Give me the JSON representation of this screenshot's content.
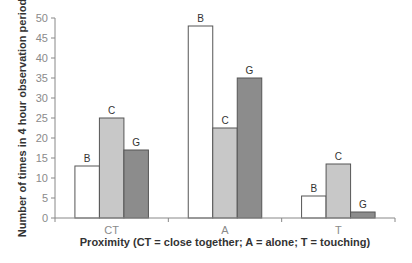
{
  "chart_data": {
    "type": "bar",
    "title": "",
    "xlabel": "Proximity (CT = close together; A = alone; T = touching)",
    "ylabel": "Number of times in 4 hour observation period",
    "categories": [
      "CT",
      "A",
      "T"
    ],
    "series": [
      {
        "name": "B",
        "color": "#ffffff",
        "values": [
          13,
          48,
          5.5
        ]
      },
      {
        "name": "C",
        "color": "#c8c8c8",
        "values": [
          25,
          22.5,
          13.5
        ]
      },
      {
        "name": "G",
        "color": "#8c8c8c",
        "values": [
          17,
          35,
          1.5
        ]
      }
    ],
    "ylim": [
      0,
      50
    ],
    "yticks": [
      0,
      5,
      10,
      15,
      20,
      25,
      30,
      35,
      40,
      45,
      50
    ],
    "grid": false,
    "legend": "none (series labeled above bars)",
    "bar_outline": "#555555"
  }
}
